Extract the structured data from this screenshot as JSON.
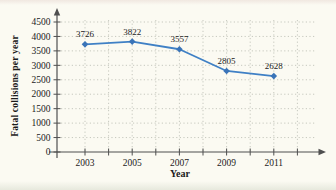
{
  "chart_data": {
    "type": "line",
    "title": "",
    "xlabel": "Year",
    "ylabel": "Fatal collisions per year",
    "x": [
      2003,
      2005,
      2007,
      2009,
      2011
    ],
    "categories": [
      "2003",
      "2005",
      "2007",
      "2009",
      "2011"
    ],
    "values": [
      3726,
      3822,
      3557,
      2805,
      2628
    ],
    "point_labels": [
      "3726",
      "3822",
      "3557",
      "2805",
      "2628"
    ],
    "series_name": "Fatal collisions",
    "ylim": [
      0,
      4500
    ],
    "yticks": [
      0,
      500,
      1000,
      1500,
      2000,
      2500,
      3000,
      3500,
      4000,
      4500
    ],
    "xticks": [
      2003,
      2004,
      2005,
      2006,
      2007,
      2008,
      2009,
      2010,
      2011,
      2012
    ],
    "xtick_labels": [
      "2003",
      "2005",
      "2007",
      "2009",
      "2011"
    ],
    "grid": "dotted",
    "legend": "none",
    "marker": "diamond",
    "colors": {
      "line": "#3f80c5",
      "marker": "#3a74b8",
      "grid": "#c1c3b9",
      "axis": "#4f4f4f",
      "text": "#1b1b1b",
      "background": "#fbfaf2"
    }
  }
}
